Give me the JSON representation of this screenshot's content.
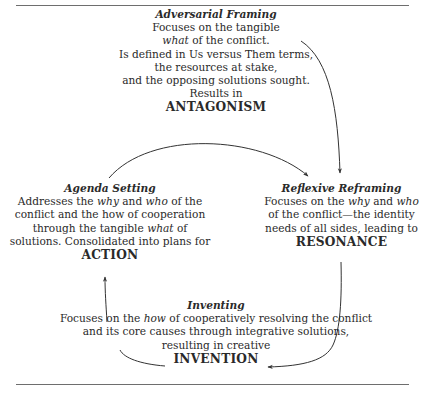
{
  "diagram": {
    "blocks": {
      "adversarial": {
        "title": "Adversarial Framing",
        "line1": "Focuses on the tangible",
        "line2_em": "what",
        "line2_rest": " of the conflict.",
        "line3": "Is defined in Us versus Them terms,",
        "line4": "the resources at stake,",
        "line5": "and the opposing solutions sought.",
        "line6": "Results in",
        "outcome": "ANTAGONISM"
      },
      "agenda": {
        "title": "Agenda Setting",
        "l1a": "Addresses the ",
        "l1b_em": "why",
        "l1c": " and ",
        "l1d_em": "who",
        "l1e": " of the",
        "line2": "conflict and the how of cooperation",
        "l3a": "through the tangible ",
        "l3b_em": "what",
        "l3c": " of",
        "line4": "solutions. Consolidated into plans for",
        "outcome": "ACTION"
      },
      "reflexive": {
        "title": "Reflexive Reframing",
        "l1a": "Focuses on the ",
        "l1b_em": "why",
        "l1c": " and ",
        "l1d_em": "who",
        "line2": "of the conflict—the identity",
        "line3": "needs of all sides, leading to",
        "outcome": "RESONANCE"
      },
      "inventing": {
        "title": "Inventing",
        "l1a": "Focuses on the ",
        "l1b_em": "how",
        "l1c": " of cooperatively resolving the conflict",
        "line2": "and its core causes through integrative solutions,",
        "line3": "resulting in creative",
        "outcome": "INVENTION"
      }
    },
    "arrows": [
      {
        "from": "adversarial",
        "to": "reflexive"
      },
      {
        "from": "agenda",
        "to": "reflexive"
      },
      {
        "from": "reflexive",
        "to": "inventing"
      },
      {
        "from": "inventing",
        "to": "agenda"
      }
    ],
    "colors": {
      "text": "#2a2a2a",
      "rule": "#6e6e6e",
      "arrow": "#333333"
    }
  }
}
